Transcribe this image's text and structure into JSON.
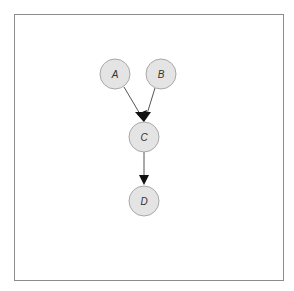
{
  "diagram": {
    "type": "directed-graph",
    "frame": {
      "border_color": "#8c8c8c",
      "background": "#ffffff"
    },
    "node_style": {
      "fill": "#e4e4e4",
      "stroke": "#a8a8a8",
      "radius": 15
    },
    "nodes": [
      {
        "id": "A",
        "label": "A",
        "cx": 115,
        "cy": 74
      },
      {
        "id": "B",
        "label": "B",
        "cx": 161,
        "cy": 74
      },
      {
        "id": "C",
        "label": "C",
        "cx": 144,
        "cy": 137
      },
      {
        "id": "D",
        "label": "D",
        "cx": 144,
        "cy": 201
      }
    ],
    "edges": [
      {
        "from": "A",
        "to": "C"
      },
      {
        "from": "B",
        "to": "C"
      },
      {
        "from": "C",
        "to": "D"
      }
    ]
  }
}
